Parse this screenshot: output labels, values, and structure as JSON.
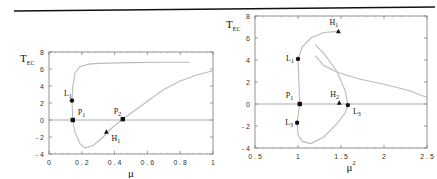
{
  "chart_data": [
    {
      "type": "line",
      "title": "",
      "xlabel": "μ",
      "ylabel": "T",
      "ylabel_sub": "EC",
      "xlim": [
        0,
        1
      ],
      "ylim": [
        -4,
        8
      ],
      "xticks": [
        0,
        0.2,
        0.4,
        0.6,
        0.8,
        1
      ],
      "xtick_labels": [
        "0",
        "0 . 2",
        "0 . 4",
        "0 . 6",
        "0 . 8",
        "1"
      ],
      "yticks": [
        -4,
        -2,
        0,
        2,
        4,
        6,
        8
      ],
      "ytick_labels": [
        "- 4",
        "- 2",
        "0",
        "2",
        "4",
        "6",
        "8"
      ],
      "grid": false,
      "series": [
        {
          "name": "upper-branch",
          "x": [
            0.14,
            0.145,
            0.16,
            0.19,
            0.25,
            0.35,
            0.5,
            0.7,
            0.86
          ],
          "y": [
            2.3,
            4.0,
            5.6,
            6.3,
            6.6,
            6.7,
            6.75,
            6.8,
            6.8
          ]
        },
        {
          "name": "lower-branch",
          "x": [
            0.14,
            0.145,
            0.16,
            0.19,
            0.22,
            0.27,
            0.33,
            0.38,
            0.43,
            0.45
          ],
          "y": [
            2.3,
            0.0,
            -1.5,
            -2.8,
            -3.3,
            -3.0,
            -2.0,
            -1.0,
            -0.2,
            0.1
          ]
        },
        {
          "name": "rising-branch",
          "x": [
            0.45,
            0.5,
            0.6,
            0.7,
            0.8,
            0.9,
            1.0
          ],
          "y": [
            0.1,
            0.8,
            2.2,
            3.6,
            4.6,
            5.3,
            5.8
          ]
        },
        {
          "name": "zero-line",
          "x": [
            0,
            1
          ],
          "y": [
            0,
            0
          ]
        }
      ],
      "points": [
        {
          "label": "L",
          "sub": "1",
          "x": 0.14,
          "y": 2.3,
          "marker": "circle"
        },
        {
          "label": "P",
          "sub": "1",
          "x": 0.145,
          "y": 0.0,
          "marker": "square"
        },
        {
          "label": "P",
          "sub": "2",
          "x": 0.45,
          "y": 0.1,
          "marker": "square"
        },
        {
          "label": "H",
          "sub": "1",
          "x": 0.35,
          "y": -1.4,
          "marker": "triangle"
        }
      ],
      "annotations": [
        "4",
        "3",
        "2",
        "1",
        "11"
      ]
    },
    {
      "type": "line",
      "title": "",
      "xlabel": "μ",
      "xlabel_sup": "2",
      "ylabel": "T",
      "ylabel_sub": "EC",
      "xlim": [
        0.5,
        2.5
      ],
      "ylim": [
        -4,
        8
      ],
      "xticks": [
        0.5,
        1,
        1.5,
        2,
        2.5
      ],
      "xtick_labels": [
        "0 . 5",
        "1",
        "1 . 5",
        "2",
        "2 . 5"
      ],
      "yticks": [
        -4,
        -2,
        0,
        2,
        4,
        6,
        8
      ],
      "ytick_labels": [
        "- 4",
        "- 2",
        "0",
        "2",
        "4",
        "6",
        "8"
      ],
      "grid": false,
      "series": [
        {
          "name": "upper-branch",
          "x": [
            1.0,
            1.05,
            1.15,
            1.3,
            1.47
          ],
          "y": [
            4.1,
            5.2,
            6.0,
            6.5,
            6.6
          ]
        },
        {
          "name": "left-branch",
          "x": [
            1.0,
            1.01,
            1.02,
            1.0,
            0.99
          ],
          "y": [
            4.1,
            2.0,
            0.0,
            -1.2,
            -1.7
          ]
        },
        {
          "name": "loop-branch",
          "x": [
            0.99,
            1.0,
            1.05,
            1.15,
            1.3,
            1.45,
            1.55,
            1.58,
            1.55,
            1.45,
            1.3,
            1.2
          ],
          "y": [
            -1.7,
            -2.8,
            -3.4,
            -3.6,
            -3.0,
            -1.8,
            -0.8,
            -0.1,
            1.2,
            3.0,
            4.6,
            5.4
          ]
        },
        {
          "name": "decay-branch",
          "x": [
            1.2,
            1.3,
            1.45,
            1.7,
            2.0,
            2.3,
            2.5
          ],
          "y": [
            4.4,
            3.5,
            2.9,
            2.3,
            1.8,
            1.2,
            0.6
          ]
        },
        {
          "name": "zero-line",
          "x": [
            0.5,
            2.5
          ],
          "y": [
            0,
            0
          ]
        }
      ],
      "points": [
        {
          "label": "H",
          "sub": "1",
          "x": 1.47,
          "y": 6.6,
          "marker": "triangle"
        },
        {
          "label": "L",
          "sub": "1",
          "x": 1.0,
          "y": 4.1,
          "marker": "circle"
        },
        {
          "label": "P",
          "sub": "1",
          "x": 1.02,
          "y": 0.0,
          "marker": "square"
        },
        {
          "label": "H",
          "sub": "2",
          "x": 1.48,
          "y": 0.1,
          "marker": "triangle"
        },
        {
          "label": "L",
          "sub": "3",
          "x": 1.58,
          "y": -0.1,
          "marker": "circle"
        },
        {
          "label": "L",
          "sub": "3",
          "x": 0.99,
          "y": -1.7,
          "marker": "circle"
        }
      ]
    }
  ]
}
